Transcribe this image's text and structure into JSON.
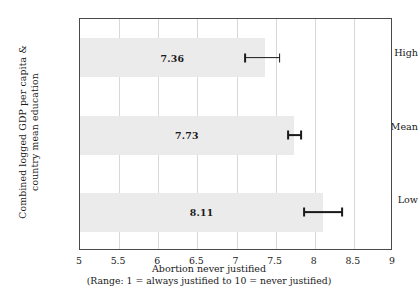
{
  "chart_data": {
    "type": "bar",
    "orientation": "horizontal",
    "title": "",
    "xlabel": "Abortion never justified",
    "xlabel_sub": "(Range: 1 = always justified to 10 = never justified)",
    "ylabel_line1": "Combined logged GDP per capita &",
    "ylabel_line2": "country mean education",
    "categories": [
      "High",
      "Mean",
      "Low"
    ],
    "values": [
      7.36,
      7.73,
      8.11
    ],
    "value_labels": [
      "7.36",
      "7.73",
      "8.11"
    ],
    "error_bars": [
      {
        "category": "High",
        "low": 7.11,
        "high": 7.55
      },
      {
        "category": "Mean",
        "low": 7.66,
        "high": 7.83
      },
      {
        "category": "Low",
        "low": 7.86,
        "high": 8.35
      }
    ],
    "xlim": [
      5,
      9
    ],
    "xticks": [
      5,
      5.5,
      6,
      6.5,
      7,
      7.5,
      8,
      8.5,
      9
    ],
    "xticklabels": [
      "5",
      "5.5",
      "6",
      "6.5",
      "7",
      "7.5",
      "8",
      "8.5",
      "9"
    ],
    "grid": "vertical",
    "legend": "none",
    "bar_color": "#ebebeb",
    "error_color": "#1a1a1a",
    "frame_color": "#4a4a4a",
    "gridline_color": "#d8d8d8"
  }
}
